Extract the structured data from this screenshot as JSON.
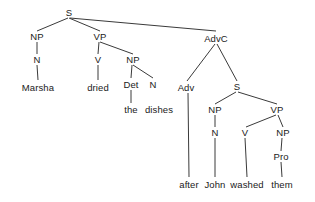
{
  "diagram": {
    "type": "constituency-parse-tree",
    "sentence": "Marsha dried the dishes after John washed them",
    "line_color": "#3a3a3a",
    "text_color": "#1a1a1a",
    "background_color": "#ffffff"
  },
  "nodes": [
    {
      "id": "S_root",
      "label": "S",
      "x": 69,
      "y": 13,
      "kind": "nonterminal"
    },
    {
      "id": "NP1",
      "label": "NP",
      "x": 37,
      "y": 37,
      "kind": "nonterminal"
    },
    {
      "id": "VP1",
      "label": "VP",
      "x": 100,
      "y": 37,
      "kind": "nonterminal"
    },
    {
      "id": "AdvC",
      "label": "AdvC",
      "x": 216,
      "y": 39,
      "kind": "nonterminal"
    },
    {
      "id": "N1",
      "label": "N",
      "x": 37,
      "y": 60,
      "kind": "nonterminal"
    },
    {
      "id": "V1",
      "label": "V",
      "x": 98,
      "y": 60,
      "kind": "nonterminal"
    },
    {
      "id": "NP2",
      "label": "NP",
      "x": 133,
      "y": 60,
      "kind": "nonterminal"
    },
    {
      "id": "Det1",
      "label": "Det",
      "x": 131,
      "y": 85,
      "kind": "nonterminal"
    },
    {
      "id": "N2",
      "label": "N",
      "x": 153,
      "y": 85,
      "kind": "nonterminal"
    },
    {
      "id": "Adv1",
      "label": "Adv",
      "x": 186,
      "y": 88,
      "kind": "nonterminal"
    },
    {
      "id": "S_embed",
      "label": "S",
      "x": 237,
      "y": 87,
      "kind": "nonterminal"
    },
    {
      "id": "NP3",
      "label": "NP",
      "x": 215,
      "y": 110,
      "kind": "nonterminal"
    },
    {
      "id": "VP2",
      "label": "VP",
      "x": 277,
      "y": 110,
      "kind": "nonterminal"
    },
    {
      "id": "N3",
      "label": "N",
      "x": 215,
      "y": 133,
      "kind": "nonterminal"
    },
    {
      "id": "V2",
      "label": "V",
      "x": 245,
      "y": 133,
      "kind": "nonterminal"
    },
    {
      "id": "NP4",
      "label": "NP",
      "x": 283,
      "y": 133,
      "kind": "nonterminal"
    },
    {
      "id": "Pro1",
      "label": "Pro",
      "x": 281,
      "y": 157,
      "kind": "nonterminal"
    },
    {
      "id": "w_marsha",
      "label": "Marsha",
      "x": 38,
      "y": 88,
      "kind": "terminal"
    },
    {
      "id": "w_dried",
      "label": "dried",
      "x": 98,
      "y": 88,
      "kind": "terminal"
    },
    {
      "id": "w_the",
      "label": "the",
      "x": 131,
      "y": 110,
      "kind": "terminal"
    },
    {
      "id": "w_dishes",
      "label": "dishes",
      "x": 159,
      "y": 110,
      "kind": "terminal"
    },
    {
      "id": "w_after",
      "label": "after",
      "x": 189,
      "y": 185,
      "kind": "terminal"
    },
    {
      "id": "w_john",
      "label": "John",
      "x": 215,
      "y": 185,
      "kind": "terminal"
    },
    {
      "id": "w_washed",
      "label": "washed",
      "x": 247,
      "y": 185,
      "kind": "terminal"
    },
    {
      "id": "w_them",
      "label": "them",
      "x": 282,
      "y": 185,
      "kind": "terminal"
    }
  ],
  "edges": [
    {
      "from": "S_root",
      "to": "NP1",
      "x1": 68,
      "y1": 18,
      "x2": 37,
      "y2": 31
    },
    {
      "from": "S_root",
      "to": "VP1",
      "x1": 69,
      "y1": 18,
      "x2": 100,
      "y2": 31
    },
    {
      "from": "S_root",
      "to": "AdvC",
      "x1": 70,
      "y1": 18,
      "x2": 216,
      "y2": 31
    },
    {
      "from": "NP1",
      "to": "N1",
      "x1": 37,
      "y1": 42,
      "x2": 37,
      "y2": 54
    },
    {
      "from": "N1",
      "to": "w_marsha",
      "x1": 37,
      "y1": 65,
      "x2": 38,
      "y2": 80
    },
    {
      "from": "VP1",
      "to": "V1",
      "x1": 99,
      "y1": 42,
      "x2": 98,
      "y2": 54
    },
    {
      "from": "VP1",
      "to": "NP2",
      "x1": 100,
      "y1": 42,
      "x2": 133,
      "y2": 54
    },
    {
      "from": "V1",
      "to": "w_dried",
      "x1": 98,
      "y1": 65,
      "x2": 98,
      "y2": 80
    },
    {
      "from": "NP2",
      "to": "Det1",
      "x1": 132,
      "y1": 65,
      "x2": 131,
      "y2": 78
    },
    {
      "from": "NP2",
      "to": "N2",
      "x1": 133,
      "y1": 65,
      "x2": 153,
      "y2": 78
    },
    {
      "from": "Det1",
      "to": "w_the",
      "x1": 131,
      "y1": 90,
      "x2": 131,
      "y2": 103
    },
    {
      "from": "AdvC",
      "to": "Adv1",
      "x1": 215,
      "y1": 44,
      "x2": 187,
      "y2": 81
    },
    {
      "from": "AdvC",
      "to": "S_embed",
      "x1": 217,
      "y1": 44,
      "x2": 237,
      "y2": 81
    },
    {
      "from": "Adv1",
      "to": "w_after",
      "x1": 188,
      "y1": 93,
      "x2": 189,
      "y2": 177
    },
    {
      "from": "S_embed",
      "to": "NP3",
      "x1": 236,
      "y1": 92,
      "x2": 215,
      "y2": 104
    },
    {
      "from": "S_embed",
      "to": "VP2",
      "x1": 238,
      "y1": 92,
      "x2": 277,
      "y2": 104
    },
    {
      "from": "NP3",
      "to": "N3",
      "x1": 215,
      "y1": 115,
      "x2": 215,
      "y2": 127
    },
    {
      "from": "N3",
      "to": "w_john",
      "x1": 215,
      "y1": 138,
      "x2": 215,
      "y2": 177
    },
    {
      "from": "VP2",
      "to": "V2",
      "x1": 276,
      "y1": 115,
      "x2": 246,
      "y2": 127
    },
    {
      "from": "VP2",
      "to": "NP4",
      "x1": 278,
      "y1": 115,
      "x2": 283,
      "y2": 127
    },
    {
      "from": "V2",
      "to": "w_washed",
      "x1": 245,
      "y1": 138,
      "x2": 247,
      "y2": 177
    },
    {
      "from": "NP4",
      "to": "Pro1",
      "x1": 282,
      "y1": 138,
      "x2": 281,
      "y2": 151
    },
    {
      "from": "Pro1",
      "to": "w_them",
      "x1": 281,
      "y1": 162,
      "x2": 282,
      "y2": 177
    }
  ]
}
